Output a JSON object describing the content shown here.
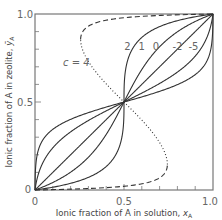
{
  "chart_data": {
    "type": "line",
    "title": "",
    "xlabel": "Ionic fraction of A in solution, x_A",
    "ylabel": "Ionic fraction of A in zeolite, ȳ_A",
    "xlim": [
      0,
      1.0
    ],
    "ylim": [
      0,
      1.0
    ],
    "x_ticks": [
      "0",
      "0.5",
      "1.0"
    ],
    "y_ticks": [
      "0",
      "0.5",
      "1.0"
    ],
    "grid": false,
    "legend": "none (curves labeled inline)",
    "model": "x = 1/(1+exp(-(ln(y/(1-y)) - c(2y-1)))), all curves pass through (0,0), (0.5,0.5), (1,1)",
    "series": [
      {
        "name": "c = 4",
        "c": 4,
        "style": "dashed (stable) / dotted (unstable branch)",
        "label_pos": [
          0.14,
          0.7
        ]
      },
      {
        "name": "2",
        "c": 2,
        "style": "solid",
        "label_pos": [
          0.52,
          0.82
        ]
      },
      {
        "name": "1",
        "c": 1,
        "style": "solid",
        "label_pos": [
          0.6,
          0.82
        ]
      },
      {
        "name": "0",
        "c": 0,
        "style": "solid",
        "label_pos": [
          0.68,
          0.82
        ]
      },
      {
        "name": "-2",
        "c": -2,
        "style": "solid",
        "label_pos": [
          0.8,
          0.82
        ]
      },
      {
        "name": "-5",
        "c": -5,
        "style": "solid",
        "label_pos": [
          0.89,
          0.82
        ]
      }
    ]
  },
  "labels": {
    "x_axis": "Ionic fraction of A in solution,",
    "x_axis_symbol": "x",
    "x_axis_sub": "A",
    "y_axis": "Ionic fraction of A in zeolite,",
    "y_axis_symbol": "ȳ",
    "y_axis_sub": "A",
    "c_prefix": "c = 4",
    "tick_0": "0",
    "tick_05": "0.5",
    "tick_10": "1.0",
    "ytick_0": "0",
    "ytick_05": "0.5",
    "ytick_10": "1.0"
  },
  "colors": {
    "axis": "#666666",
    "curve": "#333333",
    "text": "#666666"
  }
}
